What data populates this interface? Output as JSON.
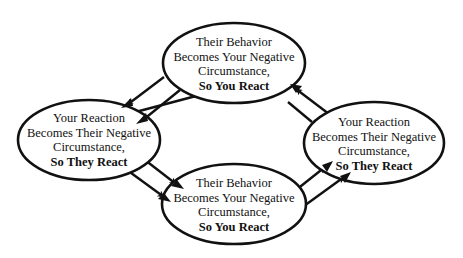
{
  "diagram": {
    "type": "cycle",
    "colors": {
      "stroke": "#111111",
      "background": "#ffffff",
      "text": "#111111"
    },
    "nodes": [
      {
        "id": "top",
        "lines": [
          "Their Behavior",
          "Becomes Your Negative",
          "Circumstance,"
        ],
        "bold_line": "So You React"
      },
      {
        "id": "left",
        "lines": [
          "Your Reaction",
          "Becomes Their Negative",
          "Circumstance,"
        ],
        "bold_line": "So They React"
      },
      {
        "id": "bottom",
        "lines": [
          "Their Behavior",
          "Becomes Your Negative",
          "Circumstance,"
        ],
        "bold_line": "So You React"
      },
      {
        "id": "right",
        "lines": [
          "Your Reaction",
          "Becomes Their Negative",
          "Circumstance,"
        ],
        "bold_line": "So They React"
      }
    ],
    "edges": [
      {
        "from": "top",
        "to": "left",
        "count": 2
      },
      {
        "from": "left",
        "to": "bottom",
        "count": 2
      },
      {
        "from": "bottom",
        "to": "right",
        "count": 2
      },
      {
        "from": "right",
        "to": "top",
        "count": 2
      }
    ]
  }
}
